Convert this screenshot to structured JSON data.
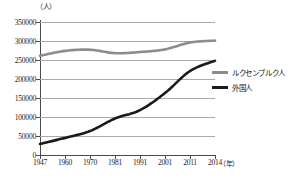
{
  "chart_data": {
    "type": "line",
    "title": "",
    "xlabel": "年",
    "ylabel": "人",
    "y_unit_label": "（人）",
    "x_unit_label": "（年）",
    "ylim": [
      0,
      350000
    ],
    "yticks": [
      0,
      50000,
      100000,
      150000,
      200000,
      250000,
      300000,
      350000
    ],
    "ytick_labels": [
      "0",
      "50000",
      "100000",
      "150000",
      "200000",
      "250000",
      "300000",
      "350000"
    ],
    "grid": true,
    "legend_position": "right",
    "categories": [
      "1947",
      "1960",
      "1970",
      "1981",
      "1991",
      "2001",
      "2011",
      "2014"
    ],
    "series": [
      {
        "name": "ルクセンブルク人",
        "color": "#8c8c8c",
        "values": [
          261000,
          274000,
          277000,
          268000,
          271000,
          278000,
          296000,
          301000
        ]
      },
      {
        "name": "外国人",
        "color": "#1a1a1a",
        "values": [
          29000,
          45000,
          63000,
          96000,
          118000,
          163000,
          221000,
          248000
        ]
      }
    ]
  },
  "legend": {
    "items": [
      {
        "label": "ルクセンブルク人",
        "color": "#8c8c8c"
      },
      {
        "label": "外国人",
        "color": "#1a1a1a"
      }
    ]
  },
  "caption": ""
}
